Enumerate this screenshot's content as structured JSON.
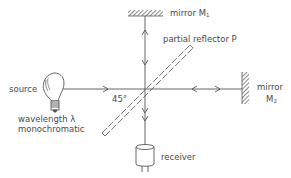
{
  "diagram": {
    "type": "michelson-interferometer",
    "colors": {
      "line": "#555555",
      "text": "#4a4a4a",
      "background": "#ffffff"
    },
    "labels": {
      "mirror1": "mirror M",
      "mirror1_sub": "1",
      "partial_reflector": "partial reflector P",
      "mirror2_line1": "mirror",
      "mirror2_line2": "M",
      "mirror2_sub": "2",
      "source": "source",
      "angle": "45°",
      "wavelength": "wavelength λ",
      "monochromatic": "monochromatic",
      "receiver": "receiver"
    },
    "components": [
      "source-bulb",
      "partial-reflector",
      "mirror-m1",
      "mirror-m2",
      "receiver"
    ]
  }
}
